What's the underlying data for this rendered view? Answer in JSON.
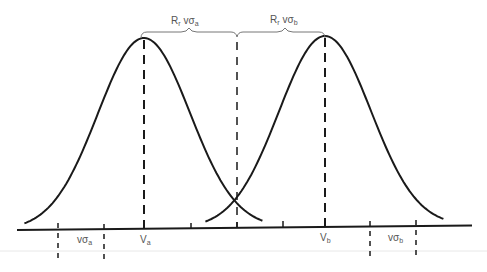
{
  "diagram": {
    "type": "two-gaussian-overlap",
    "colors": {
      "stroke": "#1a1a1a",
      "label": "#555555",
      "rule": "#e6e6e6"
    },
    "curves": [
      {
        "name": "distribution-a",
        "mean_label": "V",
        "mean_sub": "a",
        "peak_x": 144,
        "peak_y": 38,
        "sigma_px": 46
      },
      {
        "name": "distribution-b",
        "mean_label": "V",
        "mean_sub": "b",
        "peak_x": 325,
        "peak_y": 36,
        "sigma_px": 46
      }
    ],
    "brace_labels": {
      "left": {
        "R": "R",
        "R_sub": "r",
        "v": "vσ",
        "sigma_sub": "a"
      },
      "right": {
        "R": "R",
        "R_sub": "r",
        "v": "vσ",
        "sigma_sub": "b"
      }
    },
    "bottom_labels": {
      "sigma_a": {
        "text": "vσ",
        "sub": "a"
      },
      "mean_a": {
        "text": "V",
        "sub": "a"
      },
      "mean_b": {
        "text": "V",
        "sub": "b"
      },
      "sigma_b": {
        "text": "vσ",
        "sub": "b"
      }
    }
  }
}
